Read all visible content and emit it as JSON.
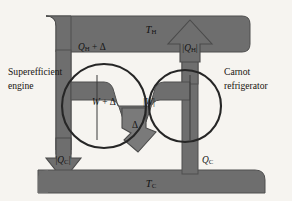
{
  "figure": {
    "type": "thermodynamics-energy-flow-diagram",
    "background_color": "#f6f4f0",
    "body_fill": "#6e6e6e",
    "body_stroke": "#4a4a4a",
    "circle_stroke": "#2a2a2a",
    "text_color": "#121212"
  },
  "reservoirs": {
    "hot": {
      "label": "T",
      "subscript": "H",
      "name": "hot-reservoir"
    },
    "cold": {
      "label": "T",
      "subscript": "C",
      "name": "cold-reservoir"
    }
  },
  "devices": {
    "left": {
      "line1": "Superefficient",
      "line2": "engine"
    },
    "right": {
      "line1": "Carnot",
      "line2": "refrigerator"
    }
  },
  "flows": {
    "hot_in_left": {
      "symbol": "Q",
      "subscript": "H",
      "suffix": " + Δ",
      "direction": "down"
    },
    "hot_out_right": {
      "prefix": "|",
      "symbol": "Q",
      "subscript": "H",
      "suffix": "|",
      "direction": "up"
    },
    "cold_out_left": {
      "prefix": "|",
      "symbol": "Q",
      "subscript": "C",
      "suffix": "|",
      "direction": "down"
    },
    "cold_in_right": {
      "symbol": "Q",
      "subscript": "C",
      "suffix": "",
      "direction": "up"
    },
    "work_left": {
      "symbol": "W",
      "suffix": " + Δ",
      "direction": "right"
    },
    "work_right": {
      "prefix": "|",
      "symbol": "W",
      "suffix": "|",
      "direction": "right"
    },
    "net_work": {
      "symbol": "Δ",
      "direction": "down-right"
    }
  }
}
